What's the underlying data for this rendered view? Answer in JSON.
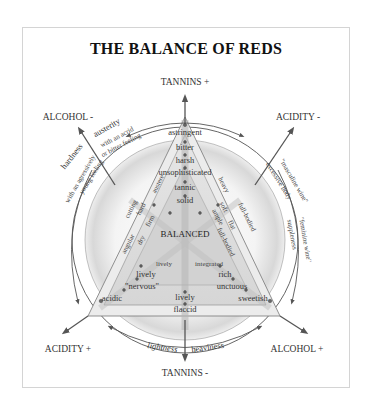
{
  "title": "THE BALANCE OF REDS",
  "axes": {
    "tannins_plus": "TANNINS +",
    "tannins_minus": "TANNINS -",
    "alcohol_minus": "ALCOHOL -",
    "alcohol_plus": "ALCOHOL +",
    "acidity_minus": "ACIDITY -",
    "acidity_plus": "ACIDITY +"
  },
  "vertical_axis_terms": [
    "astringent",
    "bitter",
    "harsh",
    "unsophisticated",
    "tannic",
    "solid"
  ],
  "center": "BALANCED",
  "left_inner_terms": [
    "firm",
    "dry",
    "lively"
  ],
  "left_mid_terms": [
    "hard",
    "austere"
  ],
  "left_outer_terms": [
    "cutting",
    "angular"
  ],
  "right_inner_terms": [
    "ample",
    "full-bodied",
    "integrated"
  ],
  "right_mid_terms": [
    "soft",
    "flat"
  ],
  "right_outer_terms": [
    "heavy",
    "full-bodied"
  ],
  "bottom_left_terms": [
    "lively",
    "\"nervous\"",
    "acidic"
  ],
  "bottom_right_terms": [
    "rich",
    "unctuous",
    "sweetish"
  ],
  "bottom_center_terms": [
    "lively",
    "flaccid"
  ],
  "arc_left": {
    "outer_top": "austerity",
    "outer_side": "hardness",
    "inner_top": "with an acrid or bitter feeling",
    "inner_top_1": "with an acrid",
    "inner_top_2": "or bitter feeling",
    "inner_side_1": "with an agressively",
    "inner_side_2": "young feeling"
  },
  "arc_right": {
    "outer_1": "\"masculine wine\"",
    "outer_2": "\"feminine wine\"",
    "inner_1": "excessive body",
    "inner_2": "suppleness"
  },
  "arc_bottom": {
    "left": "lightness",
    "right": "heaviness"
  },
  "colors": {
    "line": "#555555",
    "shade": "#cfcfcf",
    "text": "#333333"
  }
}
